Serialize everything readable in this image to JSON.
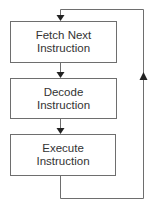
{
  "diagram": {
    "type": "flowchart",
    "nodes": [
      {
        "id": "fetch",
        "line1": "Fetch Next",
        "line2": "Instruction"
      },
      {
        "id": "decode",
        "line1": "Decode",
        "line2": "Instruction"
      },
      {
        "id": "execute",
        "line1": "Execute",
        "line2": "Instruction"
      }
    ],
    "edges": [
      {
        "from": "fetch",
        "to": "decode"
      },
      {
        "from": "decode",
        "to": "execute"
      },
      {
        "from": "execute",
        "to": "fetch",
        "style": "loop-back"
      }
    ],
    "colors": {
      "line": "#6e6e6e",
      "text": "#333333",
      "background": "#ffffff"
    }
  }
}
